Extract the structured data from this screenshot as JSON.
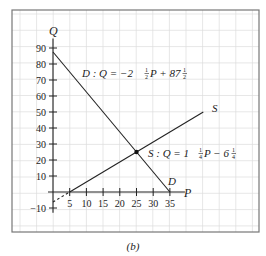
{
  "caption": "(b)",
  "colors": {
    "grid": "#dcdcdc",
    "frame": "#777777",
    "line": "#222222"
  },
  "chart_data": {
    "type": "line",
    "title": "",
    "xlabel": "P",
    "ylabel": "Q",
    "xlim": [
      -10,
      45
    ],
    "ylim": [
      -20,
      100
    ],
    "grid": true,
    "x_ticks": [
      5,
      10,
      15,
      20,
      25,
      30,
      35
    ],
    "x_tick_labels": [
      "5",
      "10",
      "15",
      "20",
      "25",
      "30",
      "35"
    ],
    "y_ticks": [
      -10,
      10,
      20,
      30,
      40,
      50,
      60,
      70,
      80,
      90
    ],
    "y_tick_labels": [
      "−10",
      "10",
      "20",
      "30",
      "40",
      "50",
      "60",
      "70",
      "80",
      "90"
    ],
    "series": [
      {
        "name": "D",
        "equation": "D : Q = −2½P + 87½",
        "end_label": "D",
        "x": [
          0,
          35
        ],
        "y": [
          87.5,
          0
        ],
        "style": "solid"
      },
      {
        "name": "S",
        "equation": "S : Q = 1¼P − 6¼",
        "end_label": "S",
        "x": [
          5,
          45
        ],
        "y": [
          0,
          50
        ],
        "style": "solid"
      },
      {
        "name": "S-extension",
        "x": [
          0,
          5
        ],
        "y": [
          -6.25,
          0
        ],
        "style": "dashed"
      }
    ],
    "annotations": [
      {
        "type": "point",
        "label": "equilibrium",
        "x": 25,
        "y": 25
      }
    ]
  },
  "labels": {
    "d_prefix": "D : Q = −2",
    "d_frac1": "1",
    "d_frac2": "2",
    "d_mid": "P + 87",
    "s_prefix": "S : Q = 1",
    "s_frac1": "1",
    "s_frac2": "4",
    "s_mid": "P − 6",
    "s_end": "S",
    "d_end": "D",
    "p_axis": "P",
    "q_axis": "Q"
  }
}
